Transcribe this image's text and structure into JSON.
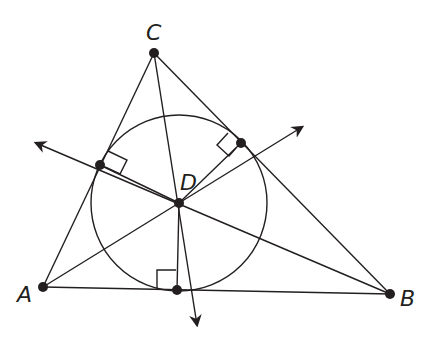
{
  "diagram": {
    "points": {
      "A": {
        "label": "A"
      },
      "B": {
        "label": "B"
      },
      "C": {
        "label": "C"
      },
      "D": {
        "label": "D"
      }
    },
    "colors": {
      "ink": "#231f20",
      "background": "#ffffff"
    }
  }
}
